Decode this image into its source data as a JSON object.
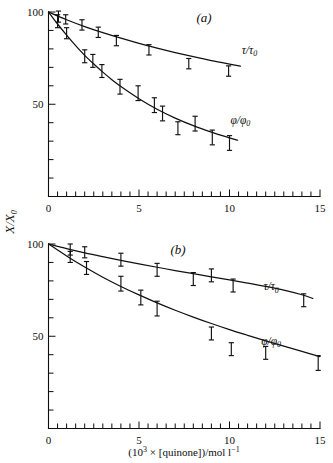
{
  "figure": {
    "background_color": "#ffffff",
    "ink_color": "#111111",
    "y_axis_label": "X/X",
    "y_axis_label_sub": "0",
    "x_axis_label_prefix": "(10",
    "x_axis_label_exp": "3",
    "x_axis_label_mid": " × [quinone])/mol l",
    "x_axis_label_sup": "−1"
  },
  "chart_data": [
    {
      "type": "scatter",
      "panel": "(a)",
      "title": "(a)",
      "xlabel": "",
      "ylabel": "X/X0",
      "xlim": [
        0,
        15
      ],
      "ylim": [
        0,
        100
      ],
      "xticks": [
        0,
        5,
        10,
        15
      ],
      "xtick_labels": [
        "0",
        "5",
        "10",
        "15"
      ],
      "xtick_minor_step": 0.5,
      "yticks": [
        0,
        10,
        20,
        30,
        40,
        50,
        60,
        70,
        80,
        90,
        100
      ],
      "ytick_labels_shown": {
        "50": "50",
        "100": "100"
      },
      "grid": false,
      "legend_position": "inline-right",
      "series": [
        {
          "name": "τ/τ₀",
          "label": "τ/τ",
          "label_sub": "0",
          "label_x": 11.1,
          "label_y": 77.5,
          "marker": "error-bar",
          "points": [
            {
              "x": 0.0,
              "y": 100.0,
              "err": 0.0
            },
            {
              "x": 0.55,
              "y": 97.5,
              "err": 3.0
            },
            {
              "x": 0.95,
              "y": 96.0,
              "err": 2.5
            },
            {
              "x": 1.85,
              "y": 93.0,
              "err": 2.8
            },
            {
              "x": 2.75,
              "y": 89.0,
              "err": 2.8
            },
            {
              "x": 3.75,
              "y": 84.5,
              "err": 2.8
            },
            {
              "x": 5.55,
              "y": 79.5,
              "err": 2.8
            },
            {
              "x": 7.75,
              "y": 72.0,
              "err": 2.8
            },
            {
              "x": 9.95,
              "y": 68.0,
              "err": 2.8
            }
          ],
          "curve": [
            {
              "x": 0.0,
              "y": 100.0
            },
            {
              "x": 1.0,
              "y": 95.8
            },
            {
              "x": 2.0,
              "y": 92.1
            },
            {
              "x": 3.0,
              "y": 88.8
            },
            {
              "x": 4.0,
              "y": 85.8
            },
            {
              "x": 5.0,
              "y": 83.0
            },
            {
              "x": 6.0,
              "y": 80.4
            },
            {
              "x": 7.0,
              "y": 78.0
            },
            {
              "x": 8.0,
              "y": 75.8
            },
            {
              "x": 9.0,
              "y": 73.7
            },
            {
              "x": 10.0,
              "y": 71.8
            },
            {
              "x": 10.6,
              "y": 70.7
            }
          ]
        },
        {
          "name": "φ/φ₀",
          "label": "φ/φ",
          "label_sub": "0",
          "label_x": 10.6,
          "label_y": 39.5,
          "marker": "error-bar",
          "points": [
            {
              "x": 0.0,
              "y": 100.0,
              "err": 0.0
            },
            {
              "x": 0.5,
              "y": 95.0,
              "err": 3.5
            },
            {
              "x": 1.0,
              "y": 88.5,
              "err": 3.0
            },
            {
              "x": 2.0,
              "y": 76.0,
              "err": 3.5
            },
            {
              "x": 2.45,
              "y": 73.5,
              "err": 3.5
            },
            {
              "x": 2.95,
              "y": 68.0,
              "err": 3.5
            },
            {
              "x": 3.95,
              "y": 59.5,
              "err": 4.0
            },
            {
              "x": 4.95,
              "y": 56.0,
              "err": 4.0
            },
            {
              "x": 5.85,
              "y": 49.5,
              "err": 4.0
            },
            {
              "x": 6.3,
              "y": 45.0,
              "err": 4.0
            },
            {
              "x": 7.15,
              "y": 37.0,
              "err": 3.5
            },
            {
              "x": 8.1,
              "y": 39.5,
              "err": 4.0
            },
            {
              "x": 9.05,
              "y": 32.0,
              "err": 4.0
            },
            {
              "x": 10.0,
              "y": 29.0,
              "err": 4.0
            }
          ],
          "curve": [
            {
              "x": 0.0,
              "y": 100.0
            },
            {
              "x": 0.5,
              "y": 93.5
            },
            {
              "x": 1.0,
              "y": 87.5
            },
            {
              "x": 1.5,
              "y": 81.8
            },
            {
              "x": 2.0,
              "y": 76.5
            },
            {
              "x": 2.5,
              "y": 71.8
            },
            {
              "x": 3.0,
              "y": 67.4
            },
            {
              "x": 3.5,
              "y": 63.3
            },
            {
              "x": 4.0,
              "y": 59.6
            },
            {
              "x": 5.0,
              "y": 53.0
            },
            {
              "x": 6.0,
              "y": 47.3
            },
            {
              "x": 7.0,
              "y": 42.5
            },
            {
              "x": 8.0,
              "y": 38.4
            },
            {
              "x": 9.0,
              "y": 34.9
            },
            {
              "x": 10.0,
              "y": 31.8
            },
            {
              "x": 10.45,
              "y": 30.5
            }
          ]
        }
      ]
    },
    {
      "type": "scatter",
      "panel": "(b)",
      "title": "(b)",
      "xlabel": "(10³ × [quinone])/mol l⁻¹",
      "ylabel": "X/X0",
      "xlim": [
        0,
        15
      ],
      "ylim": [
        0,
        100
      ],
      "xticks": [
        0,
        5,
        10,
        15
      ],
      "xtick_labels": [
        "0",
        "5",
        "10",
        "15"
      ],
      "xtick_minor_step": 0.5,
      "yticks": [
        0,
        10,
        20,
        30,
        40,
        50,
        60,
        70,
        80,
        90,
        100
      ],
      "ytick_labels_shown": {
        "50": "50",
        "100": "100"
      },
      "grid": false,
      "legend_position": "inline-right",
      "series": [
        {
          "name": "τ/τ₀",
          "label": "τ/τ",
          "label_sub": "0",
          "label_x": 12.3,
          "label_y": 75.0,
          "marker": "error-bar",
          "points": [
            {
              "x": 0.0,
              "y": 100.0,
              "err": 0.0
            },
            {
              "x": 1.2,
              "y": 97.0,
              "err": 3.0
            },
            {
              "x": 2.0,
              "y": 95.5,
              "err": 3.0
            },
            {
              "x": 4.0,
              "y": 91.5,
              "err": 3.5
            },
            {
              "x": 6.0,
              "y": 86.0,
              "err": 3.5
            },
            {
              "x": 8.0,
              "y": 81.0,
              "err": 3.5
            },
            {
              "x": 9.0,
              "y": 83.0,
              "err": 3.5
            },
            {
              "x": 10.2,
              "y": 77.5,
              "err": 3.5
            },
            {
              "x": 14.1,
              "y": 69.5,
              "err": 3.5
            }
          ],
          "curve": [
            {
              "x": 0.0,
              "y": 100.0
            },
            {
              "x": 1.0,
              "y": 97.5
            },
            {
              "x": 2.0,
              "y": 95.2
            },
            {
              "x": 3.0,
              "y": 93.1
            },
            {
              "x": 4.0,
              "y": 91.1
            },
            {
              "x": 5.0,
              "y": 89.2
            },
            {
              "x": 6.0,
              "y": 87.4
            },
            {
              "x": 7.0,
              "y": 85.6
            },
            {
              "x": 8.0,
              "y": 83.9
            },
            {
              "x": 9.0,
              "y": 82.2
            },
            {
              "x": 10.0,
              "y": 80.5
            },
            {
              "x": 11.0,
              "y": 78.8
            },
            {
              "x": 12.0,
              "y": 77.0
            },
            {
              "x": 13.0,
              "y": 75.0
            },
            {
              "x": 14.0,
              "y": 72.5
            },
            {
              "x": 14.6,
              "y": 70.5
            }
          ]
        },
        {
          "name": "φ/φ₀",
          "label": "φ/φ",
          "label_sub": "0",
          "label_x": 12.3,
          "label_y": 45.5,
          "marker": "error-bar",
          "points": [
            {
              "x": 0.0,
              "y": 100.0,
              "err": 0.0
            },
            {
              "x": 1.2,
              "y": 93.0,
              "err": 3.0
            },
            {
              "x": 2.1,
              "y": 87.0,
              "err": 3.5
            },
            {
              "x": 4.0,
              "y": 78.5,
              "err": 4.0
            },
            {
              "x": 5.1,
              "y": 71.0,
              "err": 4.0
            },
            {
              "x": 6.0,
              "y": 65.0,
              "err": 4.0
            },
            {
              "x": 9.0,
              "y": 51.5,
              "err": 3.5
            },
            {
              "x": 10.1,
              "y": 43.0,
              "err": 3.5
            },
            {
              "x": 12.0,
              "y": 41.0,
              "err": 3.5
            },
            {
              "x": 14.9,
              "y": 35.5,
              "err": 4.0
            }
          ],
          "curve": [
            {
              "x": 0.0,
              "y": 100.0
            },
            {
              "x": 1.0,
              "y": 93.5
            },
            {
              "x": 2.0,
              "y": 87.5
            },
            {
              "x": 3.0,
              "y": 82.0
            },
            {
              "x": 4.0,
              "y": 77.0
            },
            {
              "x": 5.0,
              "y": 72.4
            },
            {
              "x": 6.0,
              "y": 68.1
            },
            {
              "x": 7.0,
              "y": 64.1
            },
            {
              "x": 8.0,
              "y": 60.4
            },
            {
              "x": 9.0,
              "y": 56.9
            },
            {
              "x": 10.0,
              "y": 53.6
            },
            {
              "x": 11.0,
              "y": 50.5
            },
            {
              "x": 12.0,
              "y": 47.5
            },
            {
              "x": 13.0,
              "y": 44.6
            },
            {
              "x": 14.0,
              "y": 41.8
            },
            {
              "x": 15.0,
              "y": 39.0
            }
          ]
        }
      ]
    }
  ]
}
